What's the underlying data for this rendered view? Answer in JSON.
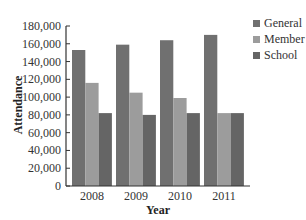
{
  "chart_data": {
    "type": "bar",
    "title": "",
    "xlabel": "Year",
    "ylabel": "Attendance",
    "categories": [
      "2008",
      "2009",
      "2010",
      "2011"
    ],
    "series": [
      {
        "name": "General",
        "color": "#707070",
        "values": [
          153000,
          159000,
          164000,
          170000
        ]
      },
      {
        "name": "Member",
        "color": "#9c9c9c",
        "values": [
          116000,
          105000,
          99000,
          82000
        ]
      },
      {
        "name": "School",
        "color": "#656565",
        "values": [
          82000,
          80000,
          82000,
          82000
        ]
      }
    ],
    "ylim": [
      0,
      180000
    ],
    "yticks": [
      0,
      20000,
      40000,
      60000,
      80000,
      100000,
      120000,
      140000,
      160000,
      180000
    ],
    "ytick_labels": [
      "0",
      "20,000",
      "40,000",
      "60,000",
      "80,000",
      "100,000",
      "120,000",
      "140,000",
      "160,000",
      "180,000"
    ],
    "grid": false,
    "legend_position": "top-right"
  }
}
